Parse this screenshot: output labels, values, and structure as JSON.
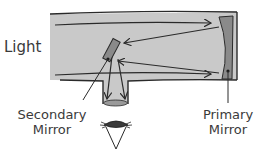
{
  "diagram": {
    "title": "TELESCOPE",
    "labels": {
      "light": "Light",
      "secondary_mirror_line1": "Secondary",
      "secondary_mirror_line2": "Mirror",
      "primary_mirror_line1": "Primary",
      "primary_mirror_line2": "Mirror"
    },
    "colors": {
      "tube_fill": "#c9c9c9",
      "outline": "#2a2a2a",
      "mirror_fill": "#8a8a8a",
      "lens_fill": "#9a9a9a",
      "text": "#3a3a3a",
      "background": "#ffffff"
    },
    "components": [
      "tube",
      "primary-mirror",
      "secondary-mirror",
      "eyepiece",
      "eye",
      "light-rays"
    ]
  }
}
